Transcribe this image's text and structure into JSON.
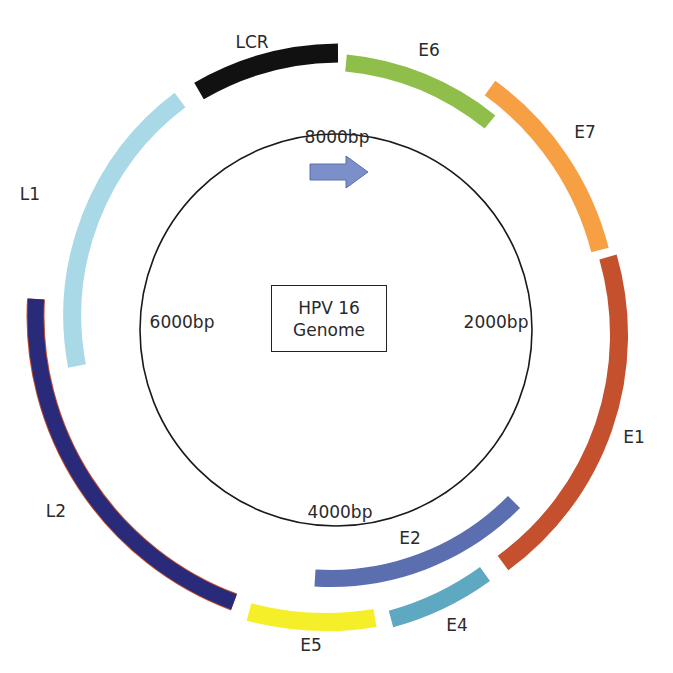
{
  "title": "HPV 16 Genome",
  "center_label": {
    "line1": "HPV 16",
    "line2": "Genome"
  },
  "positions": {
    "top": "8000bp",
    "right": "2000bp",
    "bottom": "4000bp",
    "left": "6000bp"
  },
  "direction_arrow": {
    "color": "#7b8fc8",
    "meaning": "clockwise transcription direction"
  },
  "genes": [
    {
      "name": "LCR",
      "color": "#111111"
    },
    {
      "name": "E6",
      "color": "#8fbf4a"
    },
    {
      "name": "E7",
      "color": "#f7a043"
    },
    {
      "name": "E1",
      "color": "#c4502e"
    },
    {
      "name": "E2",
      "color": "#5b6eb0"
    },
    {
      "name": "E4",
      "color": "#5fa8c2"
    },
    {
      "name": "E5",
      "color": "#f5ef2a"
    },
    {
      "name": "L2",
      "color": "#2a2a7a"
    },
    {
      "name": "L1",
      "color": "#a9d8e6"
    }
  ]
}
